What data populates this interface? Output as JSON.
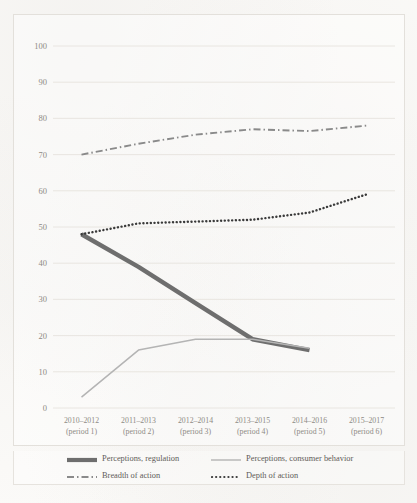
{
  "chart_data": {
    "type": "line",
    "title": "",
    "xlabel": "",
    "ylabel": "",
    "ylim": [
      0,
      100
    ],
    "ytick_labels": [
      "100",
      "90",
      "80",
      "70",
      "60",
      "50",
      "40",
      "30",
      "20",
      "10",
      "0"
    ],
    "yticks": [
      100,
      90,
      80,
      70,
      60,
      50,
      40,
      30,
      20,
      10,
      0
    ],
    "grid": true,
    "legend_position": "bottom",
    "categories": [
      "2010–2012",
      "2011–2013",
      "2012–2014",
      "2013–2015",
      "2014–2016",
      "2015–2017"
    ],
    "category_sublabels": [
      "(period 1)",
      "(period 2)",
      "(period 3)",
      "(period 4)",
      "(period 5)",
      "(period 6)"
    ],
    "series": [
      {
        "name": "Perceptions, regulation",
        "style": "solid-thick",
        "color": "#6e6e6e",
        "values": [
          48,
          39,
          29,
          19,
          16,
          null
        ]
      },
      {
        "name": "Perceptions, consumer behavior",
        "style": "solid-thin",
        "color": "#b4b4b4",
        "values": [
          3,
          16,
          19,
          19,
          16.5,
          null
        ]
      },
      {
        "name": "Breadth of action",
        "style": "dash-dot",
        "color": "#8a8a8a",
        "values": [
          70,
          73,
          75.5,
          77,
          76.5,
          78
        ]
      },
      {
        "name": "Depth of action",
        "style": "dotted",
        "color": "#3a3a3a",
        "values": [
          48,
          51,
          51.5,
          52,
          54,
          59
        ]
      }
    ]
  },
  "legend": {
    "items": [
      {
        "label": "Perceptions, regulation"
      },
      {
        "label": "Perceptions, consumer behavior"
      },
      {
        "label": "Breadth of action"
      },
      {
        "label": "Depth of action"
      }
    ]
  }
}
